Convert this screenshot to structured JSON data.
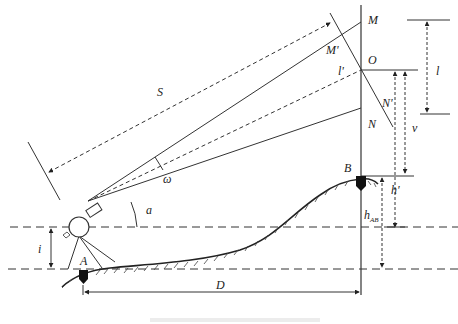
{
  "figure": {
    "type": "stadia-tachymetry-diagram",
    "labels": {
      "S": "S",
      "M": "M",
      "M_prime": "M'",
      "O": "O",
      "l_prime": "l'",
      "N_prime": "N'",
      "N": "N",
      "l": "l",
      "v": "v",
      "B": "B",
      "h_prime": "h'",
      "h_AB": "h",
      "h_AB_sub": "AB",
      "omega": "ω",
      "a": "a",
      "i": "i",
      "A": "A",
      "D": "D"
    },
    "caption": ""
  }
}
